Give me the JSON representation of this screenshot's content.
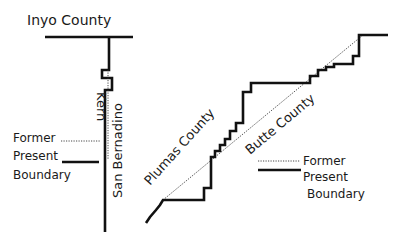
{
  "colors": {
    "present_boundary": "#111111",
    "former_boundary": "#333333",
    "text": "#1a1a1a",
    "background": "#ffffff"
  },
  "left_diagram": {
    "labels": {
      "inyo": "Inyo County",
      "kern": "Kern",
      "san_bernadino": "San Bernadino"
    },
    "legend": {
      "former": "Former",
      "present": "Present",
      "boundary": "Boundary"
    }
  },
  "right_diagram": {
    "labels": {
      "plumas": "Plumas County",
      "butte": "Butte County"
    },
    "legend": {
      "former": "Former",
      "present": "Present",
      "boundary": "Boundary"
    }
  }
}
